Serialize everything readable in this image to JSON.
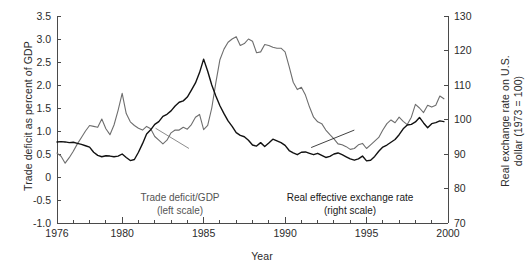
{
  "chart_data": {
    "type": "line",
    "title": "",
    "xlabel": "Year",
    "ylabel_left": "Trade deficit as percent of GDP",
    "ylabel_right": "Real exchange rate on U.S. dollar (1973 = 100)",
    "xlim": [
      1976,
      2000
    ],
    "xticks_major": [
      1976,
      1980,
      1985,
      1990,
      1995,
      2000
    ],
    "xtick_labels": [
      "1976",
      "1980",
      "1985",
      "1990",
      "1995",
      "2000"
    ],
    "xticks_minor_step": 1,
    "ylim_left": [
      -1.0,
      3.5
    ],
    "yticks_left": [
      -1.0,
      -0.5,
      0,
      0.5,
      1.0,
      1.5,
      2.0,
      2.5,
      3.0,
      3.5
    ],
    "ytick_labels_left": [
      "-1.0",
      "-0.5",
      "0",
      "0.5",
      "1.0",
      "1.5",
      "2.0",
      "2.5",
      "3.0",
      "3.5"
    ],
    "ylim_right": [
      70,
      130
    ],
    "yticks_right": [
      70,
      80,
      90,
      100,
      110,
      120,
      130
    ],
    "ytick_labels_right": [
      "70",
      "80",
      "90",
      "100",
      "110",
      "120",
      "130"
    ],
    "grid": false,
    "legend_position": "inline-annotations",
    "annotations": [
      {
        "id": "trade-deficit",
        "line1": "Trade deficit/GDP",
        "line2": "(left scale)",
        "color": "#6e6e6e",
        "leader": {
          "x1": 1984.1,
          "y1": 0.62,
          "x2": 1982.05,
          "y2": 1.06
        }
      },
      {
        "id": "real-exchange-rate",
        "line1": "Real effective exchange rate",
        "line2": "(right scale)",
        "color": "#111111",
        "leader": {
          "x1": 1991.6,
          "y1": 0.64,
          "x2": 1994.25,
          "y2": 1.02
        }
      }
    ],
    "series": [
      {
        "name": "Trade deficit/GDP",
        "axis": "left",
        "color": "#6e6e6e",
        "width": 1.1,
        "x": [
          1976,
          1976.25,
          1976.5,
          1976.75,
          1977,
          1977.25,
          1977.5,
          1977.75,
          1978,
          1978.25,
          1978.5,
          1978.75,
          1979,
          1979.25,
          1979.5,
          1979.75,
          1980,
          1980.25,
          1980.5,
          1980.75,
          1981,
          1981.25,
          1981.5,
          1981.75,
          1982,
          1982.25,
          1982.5,
          1982.75,
          1983,
          1983.25,
          1983.5,
          1983.75,
          1984,
          1984.25,
          1984.5,
          1984.75,
          1985,
          1985.25,
          1985.5,
          1985.75,
          1986,
          1986.25,
          1986.5,
          1986.75,
          1987,
          1987.25,
          1987.5,
          1987.75,
          1988,
          1988.25,
          1988.5,
          1988.75,
          1989,
          1989.25,
          1989.5,
          1989.75,
          1990,
          1990.25,
          1990.5,
          1990.75,
          1991,
          1991.25,
          1991.5,
          1991.75,
          1992,
          1992.25,
          1992.5,
          1992.75,
          1993,
          1993.25,
          1993.5,
          1993.75,
          1994,
          1994.25,
          1994.5,
          1994.75,
          1995,
          1995.25,
          1995.5,
          1995.75,
          1996,
          1996.25,
          1996.5,
          1996.75,
          1997,
          1997.25,
          1997.5,
          1997.75,
          1998,
          1998.25,
          1998.5,
          1998.75,
          1999,
          1999.25,
          1999.5,
          1999.75
        ],
        "values": [
          0.52,
          0.45,
          0.3,
          0.42,
          0.56,
          0.72,
          0.86,
          1.0,
          1.12,
          1.1,
          1.08,
          1.26,
          1.05,
          0.92,
          1.13,
          1.45,
          1.82,
          1.38,
          1.2,
          1.12,
          1.06,
          1.02,
          1.1,
          1.05,
          0.88,
          0.8,
          0.72,
          0.8,
          0.96,
          1.02,
          1.02,
          1.08,
          1.04,
          1.14,
          1.3,
          1.36,
          1.03,
          1.12,
          1.5,
          2.05,
          2.55,
          2.78,
          2.93,
          3.0,
          3.05,
          2.86,
          2.9,
          3.0,
          2.95,
          2.7,
          2.72,
          2.88,
          2.86,
          2.82,
          2.8,
          2.8,
          2.72,
          2.4,
          2.06,
          1.9,
          1.95,
          1.78,
          1.52,
          1.3,
          1.2,
          1.16,
          1.02,
          0.92,
          0.83,
          0.72,
          0.7,
          0.66,
          0.6,
          0.62,
          0.7,
          0.73,
          0.62,
          0.7,
          0.78,
          0.86,
          1.02,
          1.16,
          1.24,
          1.18,
          1.3,
          1.21,
          1.14,
          1.3,
          1.58,
          1.5,
          1.4,
          1.56,
          1.52,
          1.56,
          1.76,
          1.7
        ]
      },
      {
        "name": "Real effective exchange rate",
        "axis": "right",
        "color": "#111111",
        "width": 1.4,
        "x": [
          1976,
          1976.25,
          1976.5,
          1976.75,
          1977,
          1977.25,
          1977.5,
          1977.75,
          1978,
          1978.25,
          1978.5,
          1978.75,
          1979,
          1979.25,
          1979.5,
          1979.75,
          1980,
          1980.25,
          1980.5,
          1980.75,
          1981,
          1981.25,
          1981.5,
          1981.75,
          1982,
          1982.25,
          1982.5,
          1982.75,
          1983,
          1983.25,
          1983.5,
          1983.75,
          1984,
          1984.25,
          1984.5,
          1984.75,
          1985,
          1985.25,
          1985.5,
          1985.75,
          1986,
          1986.25,
          1986.5,
          1986.75,
          1987,
          1987.25,
          1987.5,
          1987.75,
          1988,
          1988.25,
          1988.5,
          1988.75,
          1989,
          1989.25,
          1989.5,
          1989.75,
          1990,
          1990.25,
          1990.5,
          1990.75,
          1991,
          1991.25,
          1991.5,
          1991.75,
          1992,
          1992.25,
          1992.5,
          1992.75,
          1993,
          1993.25,
          1993.5,
          1993.75,
          1994,
          1994.25,
          1994.5,
          1994.75,
          1995,
          1995.25,
          1995.5,
          1995.75,
          1996,
          1996.25,
          1996.5,
          1996.75,
          1997,
          1997.25,
          1997.5,
          1997.75,
          1998,
          1998.25,
          1998.5,
          1998.75,
          1999,
          1999.25,
          1999.5,
          1999.75
        ],
        "values": [
          93.5,
          93.6,
          93.5,
          93.3,
          93.4,
          93.1,
          92.8,
          92.4,
          92.0,
          90.5,
          89.6,
          89.2,
          89.5,
          89.4,
          89.2,
          89.4,
          90.0,
          89.0,
          88.1,
          88.4,
          90.5,
          93.0,
          95.8,
          97.0,
          98.6,
          99.4,
          100.9,
          101.5,
          102.5,
          103.9,
          105.0,
          105.4,
          106.5,
          108.5,
          110.6,
          113.6,
          117.5,
          114.0,
          110.0,
          106.8,
          104.0,
          101.7,
          99.6,
          98.0,
          96.2,
          95.4,
          95.0,
          94.0,
          92.6,
          92.3,
          93.3,
          92.2,
          93.2,
          94.3,
          93.8,
          93.3,
          92.5,
          91.0,
          90.3,
          89.8,
          90.5,
          90.6,
          90.2,
          89.8,
          90.2,
          89.6,
          89.0,
          89.3,
          90.0,
          90.3,
          89.8,
          89.2,
          88.6,
          88.2,
          88.6,
          89.4,
          88.0,
          88.2,
          89.3,
          90.8,
          92.0,
          92.6,
          93.4,
          94.2,
          95.6,
          97.3,
          98.4,
          98.6,
          99.3,
          100.6,
          99.0,
          97.6,
          98.8,
          99.1,
          99.6,
          99.4
        ]
      }
    ]
  },
  "axis_style": {
    "line_color": "#4a4a4a",
    "tick_color": "#4a4a4a",
    "text_color": "#2b2b2b"
  }
}
